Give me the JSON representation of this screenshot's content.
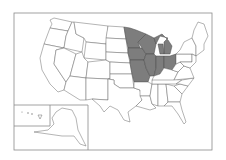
{
  "map": {
    "title": "United States map with highlighted region",
    "highlight_color": "#7d7d7d",
    "base_color": "#ffffff",
    "border_color": "#6a6a6a",
    "highlighted_states": [
      "Minnesota",
      "Wisconsin",
      "Michigan",
      "Iowa",
      "Missouri",
      "Illinois",
      "Indiana",
      "Ohio"
    ],
    "insets": [
      "Alaska",
      "Hawaii"
    ]
  }
}
